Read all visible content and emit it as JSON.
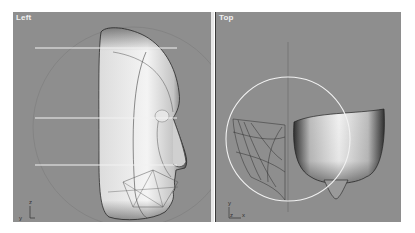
{
  "viewports": [
    {
      "label": "Left",
      "axis_gizmo": {
        "vertical": "z",
        "horizontal": "y"
      }
    },
    {
      "label": "Top",
      "axis_gizmo": {
        "vertical": "y",
        "horizontal": "x",
        "origin": "z"
      }
    }
  ],
  "colors": {
    "viewport_bg": "#8e8e8e",
    "divider": "#e8e8e8",
    "guide_line": "#f2f2f2",
    "label_text": "#f0f0f0"
  }
}
